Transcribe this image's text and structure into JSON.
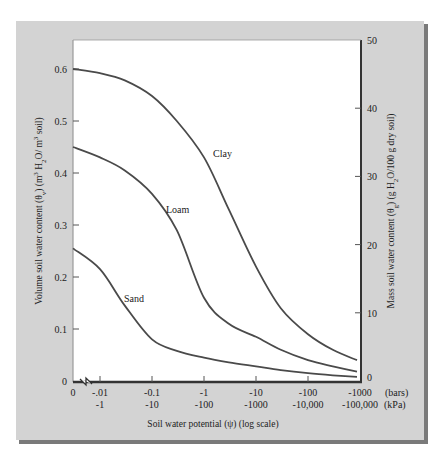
{
  "chart_data": {
    "type": "line",
    "title": "",
    "xlabel": "Soil water potential (ψ) (log scale)",
    "ylabel_left": "Volume soil water content (θv) (m³ H₂O/ m³ soil)",
    "ylabel_right": "Mass soil water content (θg) (g H₂O/100 g dry soil)",
    "x_scale": "log",
    "x_units": [
      "bars",
      "kPa"
    ],
    "x_ticks_bars": [
      "0",
      "-.01",
      "-0.1",
      "-1",
      "-10",
      "-100",
      "-1000"
    ],
    "x_ticks_kpa": [
      "",
      "-1",
      "-10",
      "-100",
      "-1000",
      "-10,000",
      "-100,000"
    ],
    "x_unit_labels": {
      "bars": "(bars)",
      "kpa": "(kPa)"
    },
    "y_left_ticks": [
      "0",
      "0.1",
      "0.2",
      "0.3",
      "0.4",
      "0.5",
      "0.6"
    ],
    "y_left_range": [
      0,
      0.6
    ],
    "y_right_ticks": [
      "0",
      "10",
      "20",
      "30",
      "40",
      "50"
    ],
    "y_right_range": [
      0,
      50
    ],
    "grid": false,
    "legend": "inline labels",
    "x_values_bars": [
      0,
      -0.01,
      -0.03,
      -0.1,
      -0.3,
      -1,
      -3,
      -10,
      -30,
      -100,
      -300,
      -1000
    ],
    "series": [
      {
        "name": "Clay",
        "values": [
          0.6,
          0.592,
          0.578,
          0.548,
          0.5,
          0.43,
          0.33,
          0.22,
          0.14,
          0.09,
          0.06,
          0.04
        ]
      },
      {
        "name": "Loam",
        "values": [
          0.45,
          0.43,
          0.405,
          0.36,
          0.29,
          0.16,
          0.11,
          0.085,
          0.06,
          0.04,
          0.028,
          0.018
        ]
      },
      {
        "name": "Sand",
        "values": [
          0.255,
          0.215,
          0.145,
          0.08,
          0.058,
          0.045,
          0.036,
          0.028,
          0.021,
          0.015,
          0.011,
          0.008
        ]
      }
    ],
    "annotations": [
      "axis break between 0 and -.01"
    ]
  },
  "style": {
    "panel_color": "#d3d3d3",
    "panel_shadow": "#7a7a7a",
    "plot_bg": "#ffffff",
    "line_color": "#4a4a4a",
    "axis_color": "#333333"
  }
}
